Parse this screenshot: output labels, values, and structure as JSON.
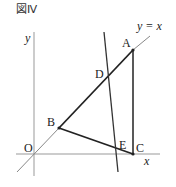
{
  "figure": {
    "title": "図Ⅳ",
    "axes": {
      "x_label": "x",
      "y_label": "y",
      "origin_label": "O"
    },
    "line_label": "y = x",
    "points": [
      {
        "name": "A",
        "x": 133,
        "y": 50
      },
      {
        "name": "B",
        "x": 59,
        "y": 128
      },
      {
        "name": "C",
        "x": 133,
        "y": 154
      },
      {
        "name": "D",
        "x": 109,
        "y": 74
      },
      {
        "name": "E",
        "x": 116,
        "y": 150
      }
    ],
    "colors": {
      "axis": "#999999",
      "thick": "#222222",
      "text": "#222222"
    }
  }
}
